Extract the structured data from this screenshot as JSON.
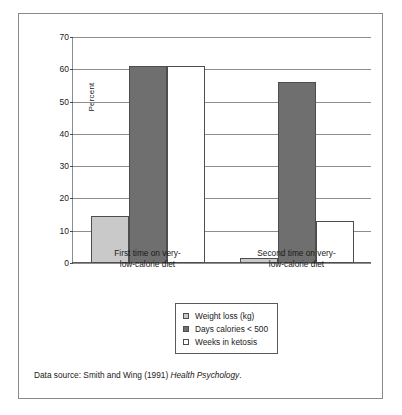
{
  "figure": {
    "source_note_prefix": "Data source: Smith and Wing (1991) ",
    "source_note_italic": "Health Psychology",
    "source_note_suffix": "."
  },
  "colors": {
    "series_weight_loss": "#c9c9c9",
    "series_days_calories": "#6f6f6f",
    "series_weeks_ketosis": "#ffffff",
    "bar_outline": "#4d4d4d",
    "gridline": "#8d8d8d",
    "axis": "#5a5a5a",
    "border": "#8a8a8a",
    "background": "#ffffff",
    "text": "#1a1a1a"
  },
  "chart_data": {
    "type": "bar",
    "title": "",
    "xlabel": "",
    "ylabel": "Percent",
    "ylim": [
      0,
      70
    ],
    "ytick_step": 10,
    "yticks": [
      0,
      10,
      20,
      30,
      40,
      50,
      60,
      70
    ],
    "ytick_labels": [
      "0",
      "10",
      "20",
      "30",
      "40",
      "50",
      "60",
      "70"
    ],
    "grid": true,
    "grid_axis": "y",
    "legend_position": "bottom-center",
    "categories": [
      "First time on very-\nlow-calorie diet",
      "Second time on very-\nlow-calorie diet"
    ],
    "category_lines": [
      [
        "First time on very-",
        "low-calorie diet"
      ],
      [
        "Second time on very-",
        "low-calorie diet"
      ]
    ],
    "series": [
      {
        "name": "Weight loss (kg)",
        "values": [
          14.5,
          1.5
        ],
        "color": "#c9c9c9"
      },
      {
        "name": "Days calories < 500",
        "values": [
          61.0,
          56.0
        ],
        "color": "#6f6f6f"
      },
      {
        "name": "Weeks in ketosis",
        "values": [
          61.0,
          13.0
        ],
        "color": "#ffffff"
      }
    ]
  }
}
